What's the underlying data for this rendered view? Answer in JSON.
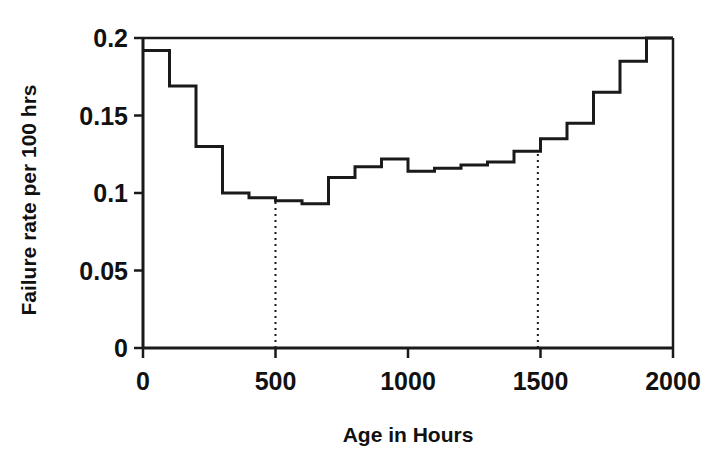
{
  "chart_data": {
    "type": "line",
    "subtype": "step",
    "title": "",
    "xlabel": "Age in Hours",
    "ylabel": "Failure rate per 100 hrs",
    "xlim": [
      0,
      2000
    ],
    "ylim": [
      0,
      0.2
    ],
    "grid": false,
    "legend": null,
    "xticks": [
      0,
      500,
      1000,
      1500,
      2000
    ],
    "xtick_labels": [
      "0",
      "500",
      "1000",
      "1500",
      "2000"
    ],
    "yticks": [
      0,
      0.05,
      0.1,
      0.15,
      0.2
    ],
    "ytick_labels": [
      "0",
      "0.05",
      "0.1",
      "0.15",
      "0.2"
    ],
    "series": [
      {
        "name": "Failure rate",
        "step_edges": [
          0,
          100,
          200,
          300,
          400,
          500,
          600,
          700,
          800,
          900,
          1000,
          1100,
          1200,
          1300,
          1400,
          1500,
          1600,
          1700,
          1800,
          1900,
          2000
        ],
        "values": [
          0.192,
          0.169,
          0.13,
          0.1,
          0.097,
          0.095,
          0.093,
          0.11,
          0.117,
          0.122,
          0.114,
          0.116,
          0.118,
          0.12,
          0.127,
          0.135,
          0.145,
          0.165,
          0.185,
          0.2
        ]
      }
    ],
    "annotations": [
      {
        "type": "vertical-dotted-line",
        "x": 500,
        "y_from": 0,
        "y_to": 0.095,
        "label": ""
      },
      {
        "type": "vertical-dotted-line",
        "x": 1490,
        "y_from": 0,
        "y_to": 0.127,
        "label": ""
      }
    ],
    "style": {
      "line_color": "#1a1a1a",
      "line_width": 3,
      "axis_color": "#1a1a1a",
      "background": "#ffffff"
    }
  }
}
